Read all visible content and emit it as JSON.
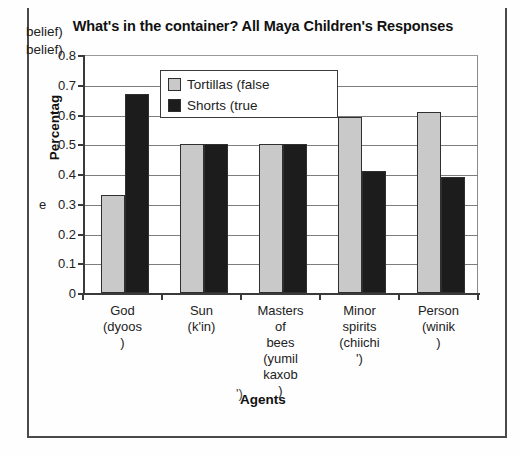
{
  "chart_data": {
    "type": "bar",
    "title": "What's in the container? All Maya Children's Responses",
    "xlabel": "Agents",
    "ylabel": "Percentage",
    "ylim": [
      0,
      0.8
    ],
    "ytick_labels": [
      "0.8",
      "0.7",
      "0.6",
      "0.5",
      "0.4",
      "0.3",
      "0.2",
      "0.1",
      "0"
    ],
    "ytick_values": [
      0.8,
      0.7,
      0.6,
      0.5,
      0.4,
      0.3,
      0.2,
      0.1,
      0
    ],
    "grid": true,
    "legend_position": "upper-left-inside",
    "categories": [
      "God (dyoos)",
      "Sun (k'in)",
      "Masters of bees (yumil kaxob)",
      "Minor spirits (chiichi')",
      "Person (winik)"
    ],
    "category_lines": [
      [
        "God",
        "(dyoos",
        ")"
      ],
      [
        "Sun",
        "(k'in)"
      ],
      [
        "Masters",
        "of",
        "bees",
        "(yumil",
        "kaxob",
        ")"
      ],
      [
        "Minor",
        "spirits",
        "(chiichi",
        "')"
      ],
      [
        "Person",
        "(winik",
        ")"
      ]
    ],
    "series": [
      {
        "name": "Tortillas (false belief)",
        "color": "#c9c9c9",
        "values": [
          0.33,
          0.5,
          0.5,
          0.59,
          0.61
        ]
      },
      {
        "name": "Shorts (true belief)",
        "color": "#1c1c1c",
        "values": [
          0.67,
          0.5,
          0.5,
          0.41,
          0.39
        ]
      }
    ]
  },
  "legend": {
    "entry0_line1": "Tortillas (false",
    "entry0_line2": "belief)",
    "entry1_line1": "Shorts (true",
    "entry1_line2": "belief)"
  },
  "axis": {
    "y_title": "Percentag",
    "y_title_artifact": "e",
    "x_title": "Agents",
    "x_title_artifact": "')"
  }
}
